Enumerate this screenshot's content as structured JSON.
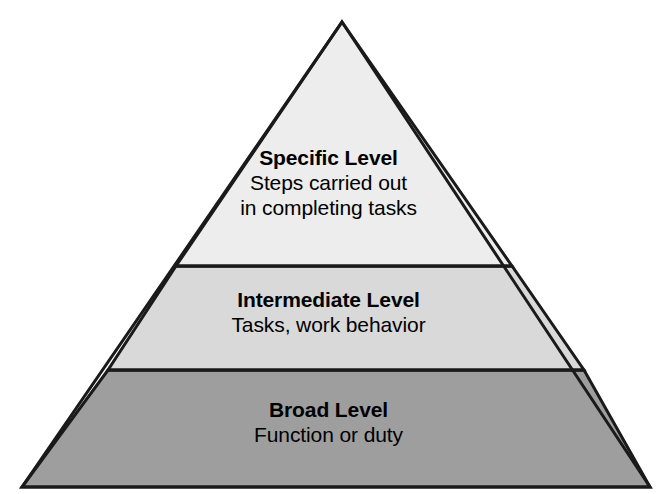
{
  "diagram": {
    "type": "pyramid",
    "background_color": "#ffffff",
    "outline_color": "#1a1a1a",
    "outline_width": 3,
    "apex": {
      "x": 342,
      "y": 22
    },
    "base_left": {
      "x": 22,
      "y": 487
    },
    "base_right": {
      "x": 650,
      "y": 487
    },
    "dividers": [
      {
        "y": 266,
        "x_left": 176,
        "x_right": 512
      },
      {
        "y": 370,
        "x_left": 108,
        "x_right": 584
      }
    ],
    "tiers": [
      {
        "id": "specific",
        "position": "top",
        "title": "Specific Level",
        "lines": [
          "Steps carried out",
          "in completing tasks"
        ],
        "fill_color": "#ededed"
      },
      {
        "id": "intermediate",
        "position": "middle",
        "title": "Intermediate Level",
        "lines": [
          "Tasks, work behavior"
        ],
        "fill_color": "#d9d9d9"
      },
      {
        "id": "broad",
        "position": "bottom",
        "title": "Broad Level",
        "lines": [
          "Function or duty"
        ],
        "fill_color": "#9e9e9e"
      }
    ]
  }
}
